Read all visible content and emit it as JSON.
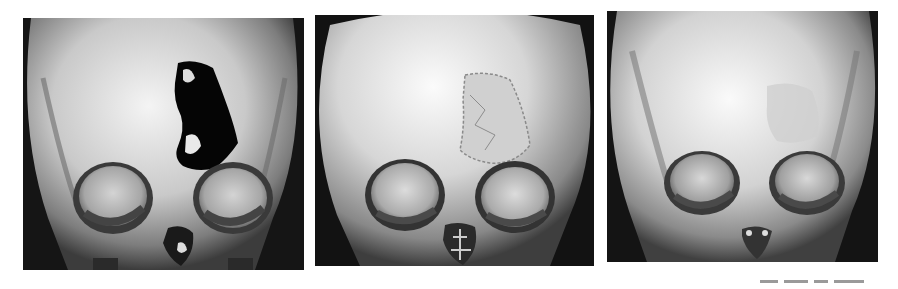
{
  "figure": {
    "panels": [
      {
        "id": "panel-1",
        "description": "3D CT reconstruction, frontal view of skull showing large frontal bone defect above right orbit (viewer's right)",
        "state": "pre-operative defect"
      },
      {
        "id": "panel-2",
        "description": "3D CT reconstruction, frontal view of skull with irregular bone graft filling frontal defect",
        "state": "early post-operative"
      },
      {
        "id": "panel-3",
        "description": "3D CT reconstruction, frontal view of skull with remodeled, integrated frontal bone graft",
        "state": "late follow-up"
      }
    ],
    "colors": {
      "background": "#ffffff",
      "panel_background": "#0c0c0c",
      "bone_light": "#f2f2f2",
      "bone_mid": "#b8b8b8",
      "bone_shadow": "#5a5a5a"
    }
  }
}
